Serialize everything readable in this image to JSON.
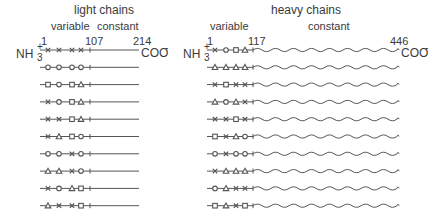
{
  "light": {
    "title": "light chains",
    "variable_label": "variable",
    "constant_label": "constant",
    "pos_start": "1",
    "pos_junction": "107",
    "pos_end": "214",
    "n_term": "NH",
    "n_plus": "+",
    "n_sub": "3",
    "c_term": "COO",
    "c_minus": "-",
    "rows": [
      [
        "x",
        "x",
        "x",
        "x"
      ],
      [
        "o",
        "o",
        "o",
        "o"
      ],
      [
        "s",
        "o",
        "s",
        "t"
      ],
      [
        "x",
        "o",
        "s",
        "t"
      ],
      [
        "x",
        "x",
        "s",
        "t"
      ],
      [
        "x",
        "t",
        "s",
        "o"
      ],
      [
        "o",
        "o",
        "x",
        "o"
      ],
      [
        "t",
        "t",
        "x",
        "o"
      ],
      [
        "x",
        "o",
        "t",
        "s"
      ],
      [
        "t",
        "x",
        "x",
        "s"
      ]
    ]
  },
  "heavy": {
    "title": "heavy chains",
    "variable_label": "variable",
    "constant_label": "constant",
    "pos_start": "1",
    "pos_junction": "117",
    "pos_end": "446",
    "n_term": "NH",
    "n_plus": "+",
    "n_sub": "3",
    "c_term": "COO",
    "c_minus": "-",
    "rows": [
      [
        "x",
        "o",
        "s",
        "t"
      ],
      [
        "t",
        "t",
        "t",
        "t"
      ],
      [
        "x",
        "s",
        "x",
        "x"
      ],
      [
        "t",
        "o",
        "t",
        "x"
      ],
      [
        "x",
        "x",
        "s",
        "x"
      ],
      [
        "s",
        "x",
        "t",
        "o"
      ],
      [
        "o",
        "x",
        "o",
        "o"
      ],
      [
        "x",
        "t",
        "t",
        "t"
      ],
      [
        "o",
        "t",
        "x",
        "x"
      ],
      [
        "s",
        "t",
        "x",
        "s"
      ]
    ]
  },
  "legend_symbols": {
    "x": "cross-mark",
    "o": "circle-mark",
    "s": "square-mark",
    "t": "triangle-mark"
  }
}
